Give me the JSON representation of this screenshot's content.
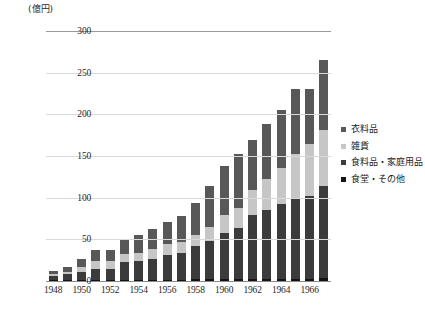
{
  "unit_label": "(億円)",
  "legend": {
    "items": [
      {
        "label": "衣料品",
        "color": "#585858"
      },
      {
        "label": "雑貨",
        "color": "#c6c6c6"
      },
      {
        "label": "食料品・家庭用品",
        "color": "#3b3b3b"
      },
      {
        "label": "食堂・その他",
        "color": "#141414"
      }
    ]
  },
  "chart_data": {
    "type": "bar",
    "stacked": true,
    "title": "",
    "subtitle": "",
    "xlabel": "",
    "ylabel": "(億円)",
    "ylim": [
      0,
      300
    ],
    "yticks": [
      0,
      50,
      100,
      150,
      200,
      250,
      300
    ],
    "ytick_labels": [
      "0",
      "50",
      "100",
      "150",
      "200",
      "250",
      "300"
    ],
    "grid": true,
    "legend_position": "right",
    "categories": [
      "1948",
      "1949",
      "1950",
      "1951",
      "1952",
      "1953",
      "1954",
      "1955",
      "1956",
      "1957",
      "1958",
      "1959",
      "1960",
      "1961",
      "1962",
      "1963",
      "1964",
      "1965",
      "1966",
      "1967"
    ],
    "xtick_labels": [
      "1948",
      "1950",
      "1952",
      "1954",
      "1956",
      "1958",
      "1960",
      "1962",
      "1964",
      "1966"
    ],
    "series": [
      {
        "name": "食堂・その他",
        "color": "#141414",
        "values": [
          1,
          1,
          1,
          1,
          1,
          1,
          1,
          1,
          1,
          1,
          2,
          2,
          2,
          3,
          3,
          3,
          3,
          3,
          3,
          4
        ]
      },
      {
        "name": "食料品・家庭用品",
        "color": "#3b3b3b",
        "values": [
          5,
          7,
          10,
          14,
          14,
          22,
          23,
          26,
          30,
          33,
          40,
          46,
          56,
          61,
          76,
          82,
          89,
          97,
          99,
          110
        ]
      },
      {
        "name": "雑貨",
        "color": "#c6c6c6",
        "values": [
          2,
          3,
          6,
          9,
          9,
          9,
          10,
          11,
          13,
          13,
          13,
          17,
          21,
          24,
          30,
          37,
          44,
          53,
          62,
          67
        ]
      },
      {
        "name": "衣料品",
        "color": "#585858",
        "values": [
          4,
          6,
          9,
          13,
          13,
          18,
          21,
          24,
          27,
          31,
          39,
          49,
          59,
          64,
          60,
          67,
          69,
          77,
          66,
          84
        ]
      }
    ],
    "totals": [
      12,
      17,
      26,
      37,
      37,
      50,
      55,
      62,
      71,
      78,
      94,
      114,
      138,
      152,
      169,
      189,
      205,
      230,
      230,
      265
    ]
  }
}
